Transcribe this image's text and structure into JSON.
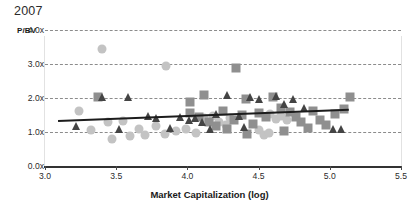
{
  "chart_data": {
    "type": "scatter",
    "title": "2007",
    "xlabel": "Market Capitalization (log)",
    "ylabel": "P/BV",
    "xlim": [
      3.0,
      5.5
    ],
    "ylim": [
      0.0,
      4.0
    ],
    "xticks": [
      "3.0",
      "3.5",
      "4.0",
      "4.5",
      "5.0",
      "5.5"
    ],
    "xtick_values": [
      3.0,
      3.5,
      4.0,
      4.5,
      5.0,
      5.5
    ],
    "yticks": [
      "0.0x",
      "1.0x",
      "2.0x",
      "3.0x",
      "4.0x"
    ],
    "ytick_values": [
      0.0,
      1.0,
      2.0,
      3.0,
      4.0
    ],
    "grid": "horizontal-dashed",
    "legend": "none",
    "colors": {
      "circle": "#c3c3c3",
      "square": "#8f8f8f",
      "triangle": "#444444",
      "trendline": "#1c1c1c",
      "gridline": "#8c8c8c",
      "axis": "#333333"
    },
    "trendline": {
      "label": "linear-fit",
      "x_start": 3.09,
      "y_start": 1.35,
      "x_end": 5.13,
      "y_end": 1.68
    },
    "series": [
      {
        "name": "circle-series",
        "marker": "circle",
        "color": "#c3c3c3",
        "points": [
          [
            3.4,
            3.45
          ],
          [
            3.85,
            2.95
          ],
          [
            3.24,
            1.62
          ],
          [
            3.32,
            1.05
          ],
          [
            3.44,
            1.28
          ],
          [
            3.47,
            0.78
          ],
          [
            3.6,
            0.88
          ],
          [
            3.66,
            1.08
          ],
          [
            3.7,
            0.92
          ],
          [
            3.78,
            1.18
          ],
          [
            3.84,
            0.95
          ],
          [
            3.92,
            1.02
          ],
          [
            3.99,
            1.1
          ],
          [
            4.06,
            0.98
          ],
          [
            4.12,
            1.4
          ],
          [
            4.18,
            1.48
          ],
          [
            4.22,
            1.3
          ],
          [
            4.27,
            1.22
          ],
          [
            4.3,
            1.42
          ],
          [
            4.58,
            1.52
          ],
          [
            4.62,
            1.38
          ],
          [
            4.66,
            1.46
          ],
          [
            4.7,
            1.34
          ],
          [
            4.5,
            1.05
          ],
          [
            4.54,
            0.92
          ],
          [
            4.57,
            0.98
          ],
          [
            3.55,
            1.32
          ]
        ]
      },
      {
        "name": "square-series",
        "marker": "square",
        "color": "#8f8f8f",
        "points": [
          [
            3.37,
            2.02
          ],
          [
            4.34,
            2.88
          ],
          [
            4.12,
            2.1
          ],
          [
            4.02,
            1.55
          ],
          [
            4.08,
            1.44
          ],
          [
            4.15,
            1.28
          ],
          [
            4.2,
            1.18
          ],
          [
            4.25,
            1.62
          ],
          [
            4.28,
            1.08
          ],
          [
            4.33,
            1.34
          ],
          [
            4.38,
            1.5
          ],
          [
            4.42,
            0.95
          ],
          [
            4.6,
            2.02
          ],
          [
            4.66,
            1.72
          ],
          [
            4.72,
            1.58
          ],
          [
            4.76,
            1.44
          ],
          [
            4.8,
            1.28
          ],
          [
            4.85,
            1.12
          ],
          [
            4.5,
            1.56
          ],
          [
            4.55,
            1.44
          ],
          [
            4.46,
            1.24
          ],
          [
            4.68,
            1.02
          ],
          [
            4.88,
            1.62
          ],
          [
            4.93,
            1.34
          ],
          [
            4.97,
            1.2
          ],
          [
            5.04,
            1.52
          ],
          [
            5.1,
            1.68
          ],
          [
            5.14,
            2.04
          ],
          [
            4.41,
            1.96
          ],
          [
            4.02,
            1.88
          ]
        ]
      },
      {
        "name": "triangle-series",
        "marker": "triangle",
        "color": "#444444",
        "points": [
          [
            3.4,
            2.04
          ],
          [
            3.22,
            1.18
          ],
          [
            3.52,
            1.1
          ],
          [
            3.72,
            1.48
          ],
          [
            3.78,
            1.42
          ],
          [
            3.88,
            1.12
          ],
          [
            3.95,
            1.44
          ],
          [
            4.01,
            1.36
          ],
          [
            4.05,
            1.42
          ],
          [
            4.1,
            1.3
          ],
          [
            4.16,
            1.08
          ],
          [
            4.28,
            2.08
          ],
          [
            4.36,
            1.46
          ],
          [
            4.4,
            1.15
          ],
          [
            4.44,
            2.02
          ],
          [
            4.5,
            1.98
          ],
          [
            4.62,
            2.06
          ],
          [
            4.68,
            1.82
          ],
          [
            4.74,
            1.96
          ],
          [
            4.82,
            1.7
          ],
          [
            5.02,
            1.08
          ],
          [
            5.08,
            1.08
          ],
          [
            3.58,
            2.02
          ],
          [
            4.2,
            1.52
          ]
        ]
      }
    ]
  }
}
